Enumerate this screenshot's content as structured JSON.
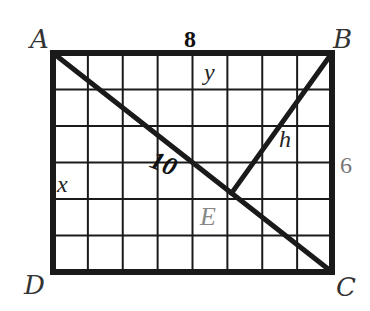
{
  "diagram": {
    "type": "geometry-rectangle-grid",
    "grid": {
      "columns": 8,
      "rows": 6
    },
    "vertices": {
      "A": {
        "label": "A",
        "grid": [
          0,
          0
        ]
      },
      "B": {
        "label": "B",
        "grid": [
          8,
          0
        ]
      },
      "C": {
        "label": "C",
        "grid": [
          8,
          6
        ]
      },
      "D": {
        "label": "D",
        "grid": [
          0,
          6
        ]
      },
      "E": {
        "label": "E",
        "grid": [
          5.12,
          3.84
        ]
      }
    },
    "segments": [
      {
        "name": "diagonal-ac",
        "from": "A",
        "to": "C",
        "label": "10"
      },
      {
        "name": "altitude-be",
        "from": "B",
        "to": "E",
        "label": "h"
      }
    ],
    "labels": {
      "top_side": "8",
      "right_side": "6",
      "diagonal": "10",
      "altitude": "h",
      "x": "x",
      "y": "y"
    },
    "colors": {
      "line": "#1a1a1a",
      "muted_label": "#777777"
    }
  }
}
